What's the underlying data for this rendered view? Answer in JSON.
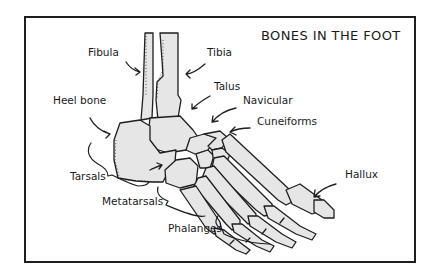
{
  "diagram": {
    "title": "BONES IN THE FOOT",
    "labels": {
      "fibula": "Fibula",
      "tibia": "Tibia",
      "talus": "Talus",
      "navicular": "Navicular",
      "cuneiforms": "Cuneiforms",
      "heel_bone": "Heel bone",
      "tarsals": "Tarsals",
      "metatarsals": "Metatarsals",
      "phalanges": "Phalanges",
      "hallux": "Hallux"
    },
    "colors": {
      "bone_fill": "#e6e6e6",
      "ink": "#1e1e1e",
      "background": "#ffffff"
    }
  }
}
